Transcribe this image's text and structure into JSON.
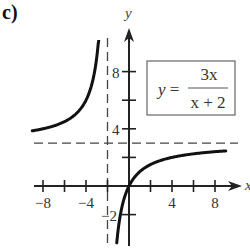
{
  "panel_label": "c)",
  "equation": {
    "lhs": "y =",
    "numerator": "3x",
    "denominator": "x + 2"
  },
  "chart_data": {
    "type": "line",
    "title": "",
    "function": "y = 3x / (x + 2)",
    "xlabel": "x",
    "ylabel": "y",
    "xlim": [
      -9.5,
      10.5
    ],
    "ylim": [
      -4.2,
      11
    ],
    "x_ticks": [
      -8,
      -6,
      -4,
      -2,
      2,
      4,
      6,
      8
    ],
    "x_tick_labels": [
      "-8",
      "-4",
      "4",
      "8"
    ],
    "x_tick_label_values": [
      -8,
      -4,
      4,
      8
    ],
    "y_ticks": [
      -2,
      2,
      4,
      6,
      8
    ],
    "y_tick_labels": [
      "-2",
      "4",
      "8"
    ],
    "y_tick_label_values": [
      -2,
      4,
      8
    ],
    "asymptotes": {
      "vertical": -2,
      "horizontal": 3
    },
    "series": [
      {
        "name": "left branch",
        "x": [
          -9,
          -8,
          -7,
          -6,
          -5,
          -4,
          -3.5,
          -3,
          -2.75,
          -2.5,
          -2.43
        ],
        "y": [
          3.86,
          4.0,
          4.2,
          4.5,
          5.0,
          6.0,
          7.0,
          9.0,
          11.0,
          15.0,
          17.0
        ]
      },
      {
        "name": "right branch",
        "x": [
          -1.14,
          -1,
          -0.5,
          0,
          1,
          2,
          4,
          6,
          8,
          9
        ],
        "y": [
          -4.0,
          -3.0,
          -1.0,
          0,
          1.0,
          1.5,
          2.0,
          2.25,
          2.4,
          2.45
        ]
      }
    ],
    "grid": false,
    "legend": "none",
    "annotation": "boxed equation y = 3x/(x+2), upper right"
  }
}
